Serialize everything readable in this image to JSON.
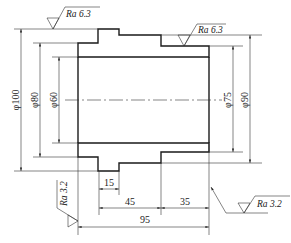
{
  "drawing": {
    "type": "sectional view of stepped bushing",
    "diameters": {
      "left": [
        {
          "id": "d100",
          "label": "φ100"
        },
        {
          "id": "d80",
          "label": "φ80"
        },
        {
          "id": "d60",
          "label": "φ60"
        }
      ],
      "right": [
        {
          "id": "d75",
          "label": "φ75"
        },
        {
          "id": "d90",
          "label": "φ90"
        }
      ]
    },
    "lengths": [
      {
        "id": "l15",
        "label": "15"
      },
      {
        "id": "l45",
        "label": "45"
      },
      {
        "id": "l35",
        "label": "35"
      },
      {
        "id": "l95",
        "label": "95"
      }
    ],
    "roughness": [
      {
        "id": "ra_top_left",
        "label": "Ra 6.3"
      },
      {
        "id": "ra_top_right",
        "label": "Ra 6.3"
      },
      {
        "id": "ra_bottom_left",
        "label": "Ra 3.2"
      },
      {
        "id": "ra_bottom_right",
        "label": "Ra 3.2"
      }
    ]
  }
}
